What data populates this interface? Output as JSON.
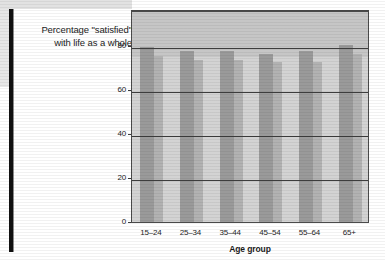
{
  "title": {
    "line1": "Percentage \"satisfied\"",
    "line2": "with life as a whole"
  },
  "axis": {
    "xlabel": "Age group",
    "ylabel": ""
  },
  "colors": {
    "bar_primary": "#9a9a9a",
    "bar_secondary": "#b2b2b2",
    "plot_background": "#d3d3d3",
    "plot_upper_background": "#c6c6c6",
    "gridline": "#3d3d3d",
    "frame": "#4a4a4a",
    "left_rule": "#111111",
    "text": "#1b1b1b"
  },
  "chart_data": {
    "type": "bar",
    "title": "Percentage \"satisfied\" with life as a whole",
    "xlabel": "Age group",
    "ylabel": "",
    "categories": [
      "15–24",
      "25–34",
      "35–44",
      "45–54",
      "55–64",
      "65+"
    ],
    "series": [
      {
        "name": "series-1",
        "values": [
          80,
          78,
          78,
          77,
          78,
          81
        ]
      },
      {
        "name": "series-2",
        "values": [
          76,
          74,
          74,
          73,
          73,
          77
        ]
      }
    ],
    "yticks": [
      0,
      20,
      40,
      60,
      80
    ],
    "ylim": [
      0,
      95
    ],
    "grid": true,
    "legend": "none"
  }
}
